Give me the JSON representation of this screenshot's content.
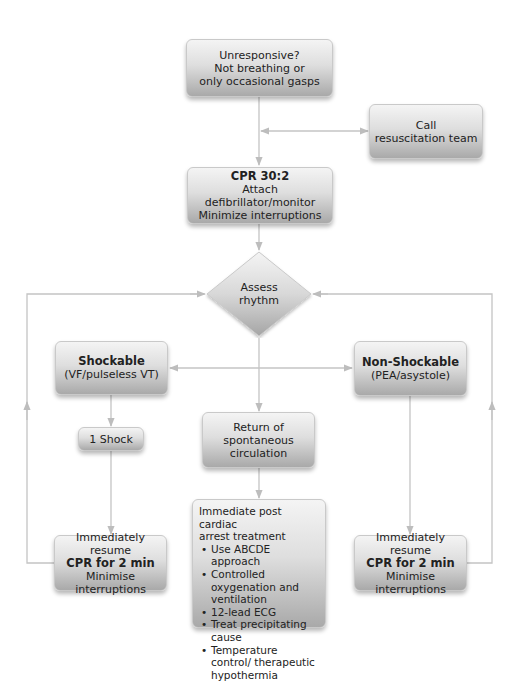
{
  "colors": {
    "box_gradient_top": "#f4f4f4",
    "box_gradient_bottom": "#a9a9a9",
    "box_border": "#c9c9c9",
    "connector": "#c4c4c4",
    "background": "#ffffff"
  },
  "nodes": {
    "unresponsive": {
      "line1": "Unresponsive?",
      "line2": "Not breathing or",
      "line3": "only occasional gasps"
    },
    "call_team": {
      "line1": "Call",
      "line2": "resuscitation team"
    },
    "cpr": {
      "title": "CPR 30:2",
      "line1": "Attach defibrillator/monitor",
      "line2": "Minimize interruptions"
    },
    "assess": {
      "line1": "Assess",
      "line2": "rhythm"
    },
    "shockable": {
      "title": "Shockable",
      "line1": "(VF/pulseless VT)"
    },
    "non_shockable": {
      "title": "Non-Shockable",
      "line1": "(PEA/asystole)"
    },
    "one_shock": {
      "label": "1 Shock"
    },
    "rosc": {
      "line1": "Return of",
      "line2": "spontaneous",
      "line3": "circulation"
    },
    "post_arrest": {
      "heading1": "Immediate post cardiac",
      "heading2": "arrest treatment",
      "items": [
        "Use ABCDE approach",
        "Controlled oxygenation and ventilation",
        "12-lead ECG",
        "Treat precipitating cause",
        "Temperature control/ therapeutic hypothermia"
      ]
    },
    "resume_left": {
      "line1": "Immediately resume",
      "title": "CPR for 2 min",
      "line2": "Minimise interruptions"
    },
    "resume_right": {
      "line1": "Immediately resume",
      "title": "CPR for 2 min",
      "line2": "Minimise interruptions"
    }
  }
}
